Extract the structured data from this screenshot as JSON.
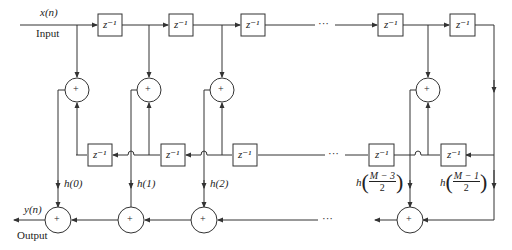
{
  "diagram": {
    "type": "linear-phase FIR filter structure (M odd)",
    "input": {
      "signal": "x(n)",
      "label": "Input"
    },
    "output": {
      "signal": "y(n)",
      "label": "Output"
    },
    "delay_label": "z⁻¹",
    "adder_symbol": "+",
    "ellipsis": "···",
    "coefficients": [
      "h(0)",
      "h(1)",
      "h(2)",
      "h((M−3)/2)",
      "h((M−1)/2)"
    ],
    "coef_parts": {
      "h": "h",
      "m3_num": "M − 3",
      "m1_num": "M − 1",
      "den": "2"
    },
    "labels": {
      "h0": "h(0)",
      "h1": "h(1)",
      "h2": "h(2)"
    }
  }
}
